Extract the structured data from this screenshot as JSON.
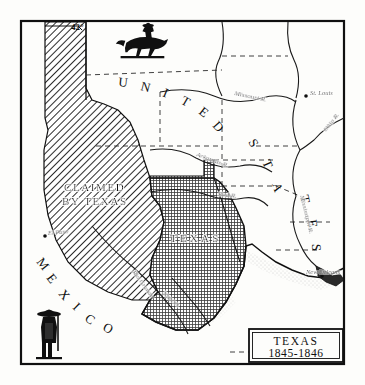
{
  "figure": {
    "kind": "historical-map-illustration",
    "title_cartouche": {
      "line1": "TEXAS",
      "line2": "1845-1846"
    },
    "colors": {
      "ink": "#101010",
      "paper": "#fdfdfb",
      "claimed_hatch": "#2b2b2b",
      "texas_fill": "#4a4a4a",
      "water": "#6f6f6f"
    }
  },
  "regions": [
    {
      "id": "claimed-by-texas",
      "label_lines": [
        "CLAIMED",
        "BY TEXAS"
      ],
      "fill_style": "diagonal-hatch"
    },
    {
      "id": "texas",
      "label": "TEXAS",
      "fill_style": "dense-crosshatch"
    },
    {
      "id": "united-states",
      "label_letters": [
        "U",
        "N",
        "I",
        "T",
        "E",
        "D",
        "S",
        "T",
        "A",
        "T",
        "E",
        "S"
      ],
      "label_text": "UNITED STATES",
      "fill_style": "blank"
    },
    {
      "id": "mexico",
      "label_letters": [
        "M",
        "E",
        "X",
        "I",
        "C",
        "O"
      ],
      "label_text": "MEXICO",
      "fill_style": "blank"
    }
  ],
  "graticule": [
    {
      "id": "lat-42",
      "label": "42°"
    }
  ],
  "cities": [
    {
      "name": "St. Louis"
    },
    {
      "name": "New Orleans"
    },
    {
      "name": "El Paso"
    }
  ],
  "rivers": [
    {
      "name": "Missouri R."
    },
    {
      "name": "Arkansas R."
    },
    {
      "name": "Red R."
    },
    {
      "name": "Ohio R."
    },
    {
      "name": "Mississippi R."
    },
    {
      "name": "Rio Grande"
    },
    {
      "name": "Nueces"
    }
  ],
  "vignettes": [
    {
      "id": "horseman",
      "description": "rider-on-horseback"
    },
    {
      "id": "standing-figure",
      "description": "sombrero-figure"
    }
  ]
}
